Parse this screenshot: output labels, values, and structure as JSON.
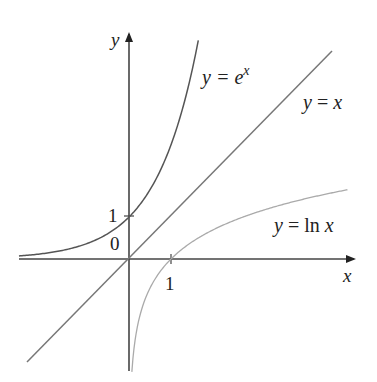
{
  "chart_data": {
    "type": "line",
    "title": "",
    "xlabel": "x",
    "ylabel": "y",
    "xlim": [
      -2.6,
      5.4
    ],
    "ylim": [
      -2.6,
      5.2
    ],
    "grid": false,
    "series": [
      {
        "name": "y = e^x",
        "function": "exp(x)",
        "x_range": [
          -2.6,
          1.65
        ],
        "color": "#555555"
      },
      {
        "name": "y = x",
        "function": "x",
        "x_range": [
          -2.4,
          4.9
        ],
        "color": "#777777"
      },
      {
        "name": "y = ln x",
        "function": "ln(x)",
        "x_range": [
          0.07,
          5.2
        ],
        "color": "#aaaaaa"
      }
    ],
    "ticks": {
      "x": [
        "1"
      ],
      "y": [
        "1"
      ]
    },
    "annotations": [
      "0"
    ]
  },
  "labels": {
    "y_axis": "y",
    "x_axis": "x",
    "origin": "0",
    "x_tick_1": "1",
    "y_tick_1": "1",
    "exp_y": "y",
    "exp_eq": " = e",
    "exp_sup": "x",
    "id_y": "y",
    "id_eq": " = ",
    "id_x": "x",
    "ln_y": "y",
    "ln_eq": " = ln ",
    "ln_x": "x"
  }
}
